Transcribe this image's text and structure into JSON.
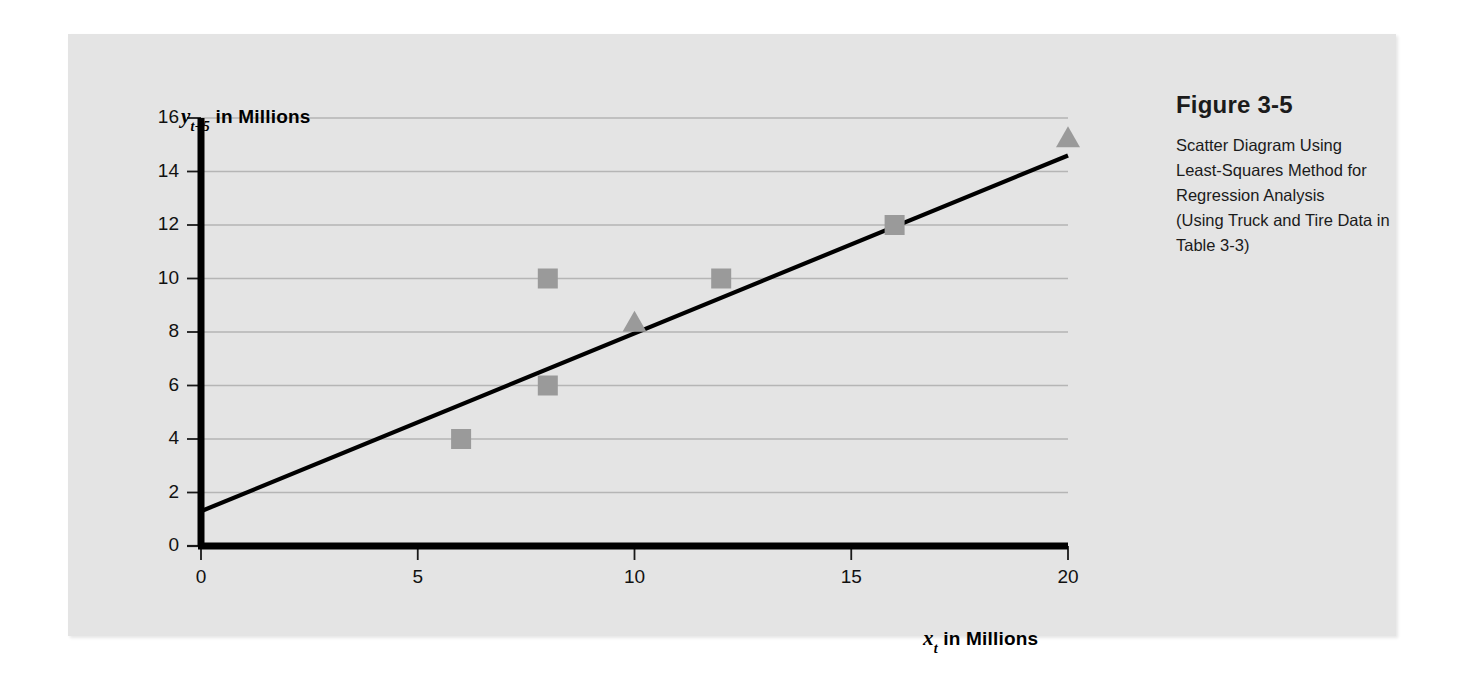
{
  "figure": {
    "caption_title": "Figure 3-5",
    "caption_lines": [
      "Scatter Diagram Using",
      "Least-Squares Method for",
      "Regression Analysis",
      "(Using Truck and Tire Data in",
      "Table 3-3)"
    ],
    "panel_color": "#e4e4e4",
    "marker_color": "#9a9a9a",
    "line_color": "#000000",
    "grid_color": "#b5b5b5"
  },
  "chart_data": {
    "type": "scatter",
    "xlabel": "x_t in Millions",
    "ylabel": "y_t+5 in Millions",
    "xlabel_parts": {
      "variable": "x",
      "subscript": "t",
      "suffix": " in Millions"
    },
    "ylabel_parts": {
      "variable": "y",
      "subscript": "t+5",
      "suffix": " in Millions"
    },
    "xlim": [
      0,
      20
    ],
    "ylim": [
      0,
      16
    ],
    "xticks": [
      0,
      5,
      10,
      15,
      20
    ],
    "yticks": [
      0,
      2,
      4,
      6,
      8,
      10,
      12,
      14,
      16
    ],
    "grid": "horizontal",
    "legend": "none",
    "series": [
      {
        "name": "Observed data",
        "marker": "square",
        "color": "#9a9a9a",
        "points": [
          {
            "x": 6,
            "y": 4
          },
          {
            "x": 8,
            "y": 10
          },
          {
            "x": 8,
            "y": 6
          },
          {
            "x": 12,
            "y": 10
          },
          {
            "x": 16,
            "y": 12
          }
        ]
      },
      {
        "name": "Forecast points",
        "marker": "triangle",
        "color": "#9a9a9a",
        "points": [
          {
            "x": 10,
            "y": 8.4
          },
          {
            "x": 20,
            "y": 15.3
          }
        ]
      }
    ],
    "trendline": {
      "name": "Least-squares regression line",
      "x0": 0,
      "y0": 1.3,
      "x1": 20,
      "y1": 14.6,
      "intercept": 1.3,
      "slope": 0.665,
      "color": "#000000"
    }
  }
}
